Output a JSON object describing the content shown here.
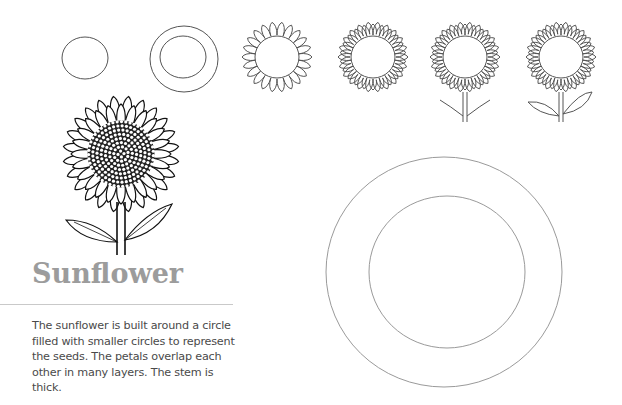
{
  "page": {
    "title": "Sunflower",
    "description": "The sunflower is built around a circle filled with smaller circles to represent the seeds. The petals overlap each other in many layers. The stem is thick."
  },
  "steps": [
    {
      "index": 1,
      "label": "circle"
    },
    {
      "index": 2,
      "label": "inner and outer circle"
    },
    {
      "index": 3,
      "label": "petal ring"
    },
    {
      "index": 4,
      "label": "overlapping petal layers"
    },
    {
      "index": 5,
      "label": "stem and leaf veins"
    },
    {
      "index": 6,
      "label": "leaves"
    }
  ],
  "illustrations": {
    "finished": "finished-sunflower-ink",
    "practice": "large-double-circle-guide"
  },
  "colors": {
    "title": "#9c9c9c",
    "text": "#4a4a4a",
    "divider": "#c9c9c9",
    "pencil": "#555555"
  }
}
